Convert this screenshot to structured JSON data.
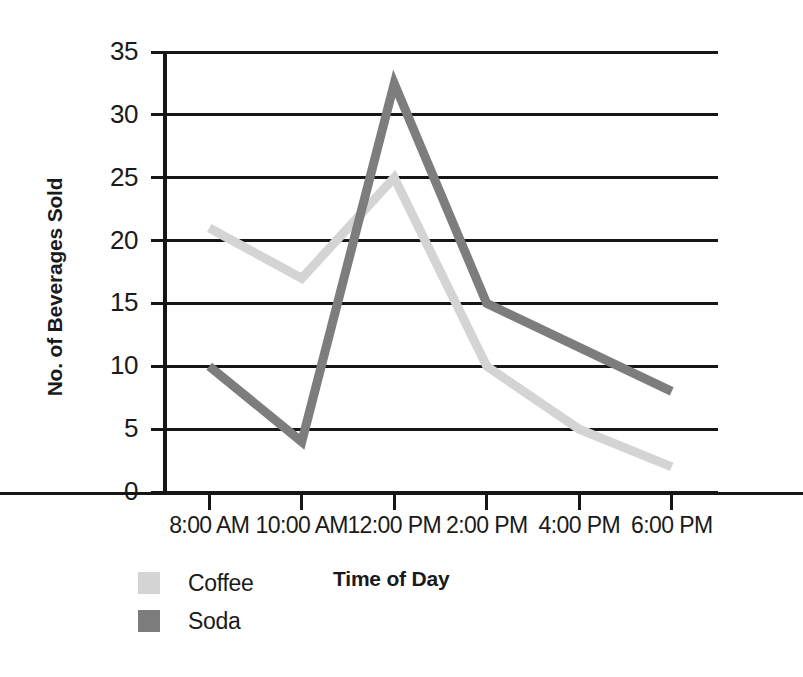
{
  "chart_data": {
    "type": "line",
    "title": "",
    "xlabel": "Time of Day",
    "ylabel": "No. of Beverages Sold",
    "categories": [
      "8:00 AM",
      "10:00 AM",
      "12:00 PM",
      "2:00 PM",
      "4:00 PM",
      "6:00 PM"
    ],
    "series": [
      {
        "name": "Coffee",
        "color": "#d4d4d4",
        "values": [
          21,
          17,
          25,
          10,
          5,
          2
        ]
      },
      {
        "name": "Soda",
        "color": "#7d7d7d",
        "values": [
          10,
          4,
          32.5,
          15,
          11.5,
          8
        ]
      }
    ],
    "ylim": [
      0,
      35
    ],
    "yticks": [
      0,
      5,
      10,
      15,
      20,
      25,
      30,
      35
    ],
    "ytick_labels": [
      "0",
      "5",
      "10",
      "15",
      "20",
      "25",
      "30",
      "35"
    ],
    "grid": true,
    "legend_position": "bottom-left"
  },
  "axes": {
    "y_title": "No. of Beverages Sold",
    "x_title": "Time of Day"
  },
  "legend": {
    "items": [
      {
        "label": "Coffee",
        "color": "#d4d4d4"
      },
      {
        "label": "Soda",
        "color": "#7d7d7d"
      }
    ]
  },
  "colors": {
    "coffee": "#d4d4d4",
    "soda": "#7d7d7d",
    "axis": "#161616",
    "background": "#ffffff"
  }
}
